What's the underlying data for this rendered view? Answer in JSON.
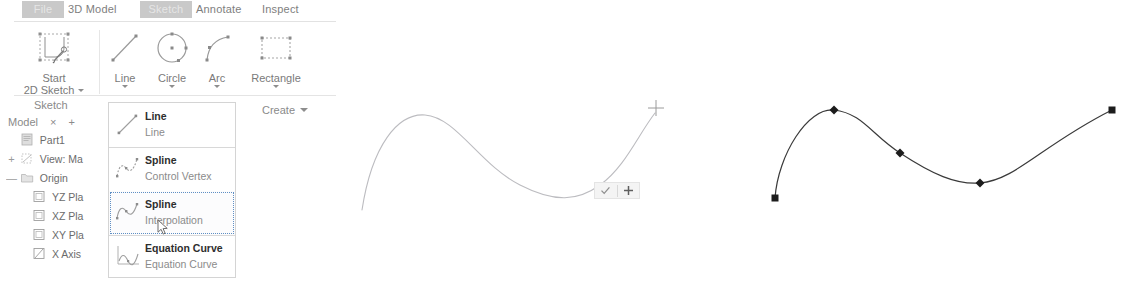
{
  "app": {
    "colors": {
      "tab_active_bg": "#c9c9c9",
      "menu_border": "#d4d4d4",
      "menu_hover_outline": "#5f8fc4",
      "ghost_curve": "#b9b9bd",
      "final_curve": "#3a3a3a",
      "text_gray": "#7a7a7a"
    }
  },
  "ribbon": {
    "tabs": [
      {
        "label": "File",
        "active": true
      },
      {
        "label": "3D Model",
        "active": false
      },
      {
        "label": "Sketch",
        "active": true
      },
      {
        "label": "Annotate",
        "active": false
      },
      {
        "label": "Inspect",
        "active": false
      }
    ],
    "buttons": [
      {
        "caption": "Start",
        "caption2": "2D Sketch",
        "icon": "sketch-pencil-icon"
      },
      {
        "caption": "Line",
        "caption2": "",
        "icon": "line-icon"
      },
      {
        "caption": "Circle",
        "caption2": "",
        "icon": "circle-icon"
      },
      {
        "caption": "Arc",
        "caption2": "",
        "icon": "arc-icon"
      },
      {
        "caption": "Rectangle",
        "caption2": "",
        "icon": "rectangle-icon"
      }
    ],
    "panels": [
      {
        "label": "Sketch"
      },
      {
        "label": "Create"
      }
    ]
  },
  "browser": {
    "bar": {
      "title": "Model",
      "close_label": "×",
      "add_label": "+"
    },
    "tree": [
      {
        "expander": "",
        "label": "Part1",
        "icon": "part-document-icon",
        "indent": 1
      },
      {
        "expander": "+",
        "label": "View: Ma",
        "icon": "view-icon",
        "indent": 1
      },
      {
        "expander": "—",
        "label": "Origin",
        "icon": "origin-folder-icon",
        "indent": 1
      },
      {
        "expander": "",
        "label": "YZ Pla",
        "icon": "plane-icon",
        "indent": 2
      },
      {
        "expander": "",
        "label": "XZ Pla",
        "icon": "plane-icon",
        "indent": 2
      },
      {
        "expander": "",
        "label": "XY Pla",
        "icon": "plane-icon",
        "indent": 2
      },
      {
        "expander": "",
        "label": "X Axis",
        "icon": "axis-icon",
        "indent": 2
      }
    ]
  },
  "flyout": {
    "items": [
      {
        "title": "Line",
        "sub": "Line",
        "icon": "line-sketch-icon",
        "hovered": false
      },
      {
        "title": "Spline",
        "sub": "Control Vertex",
        "icon": "spline-cv-icon",
        "hovered": false
      },
      {
        "title": "Spline",
        "sub": "Interpolation",
        "icon": "spline-interp-icon",
        "hovered": true
      },
      {
        "title": "Equation Curve",
        "sub": "Equation Curve",
        "icon": "equation-curve-icon",
        "hovered": false
      }
    ]
  },
  "canvas": {
    "mini_toolbar": {
      "accept_label": "✓",
      "add_point_label": "+"
    },
    "in_progress_spline": {
      "state": "drawing",
      "cursor": "crosshair"
    },
    "finished_spline": {
      "state": "complete",
      "point_count": 5,
      "endpoint_shape": "square",
      "interior_shape": "diamond"
    }
  }
}
